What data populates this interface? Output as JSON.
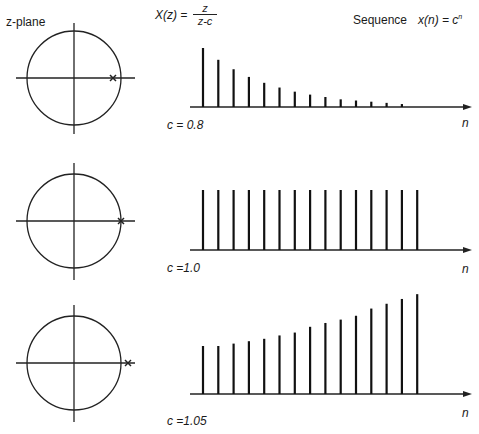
{
  "header": {
    "zplane_label": "z-plane",
    "transform_lhs": "X(z) =",
    "transform_num": "z",
    "transform_den": "z-c",
    "sequence_label": "Sequence",
    "sequence_formula": "x(n) = c",
    "sequence_exponent": "n"
  },
  "panels": [
    {
      "c_label": "c = 0.8",
      "n_label": "n",
      "c": 0.8
    },
    {
      "c_label": "c =1.0",
      "n_label": "n",
      "c": 1.0
    },
    {
      "c_label": "c =1.05",
      "n_label": "n",
      "c": 1.05
    }
  ],
  "chart_data": [
    {
      "type": "stem",
      "title": "c = 0.8",
      "xlabel": "n",
      "x": [
        0,
        1,
        2,
        3,
        4,
        5,
        6,
        7,
        8,
        9,
        10,
        11,
        12,
        13
      ],
      "values": [
        1.0,
        0.8,
        0.64,
        0.51,
        0.41,
        0.33,
        0.26,
        0.21,
        0.17,
        0.13,
        0.11,
        0.09,
        0.07,
        0.05
      ],
      "pole": 0.8
    },
    {
      "type": "stem",
      "title": "c =1.0",
      "xlabel": "n",
      "x": [
        0,
        1,
        2,
        3,
        4,
        5,
        6,
        7,
        8,
        9,
        10,
        11,
        12,
        13,
        14
      ],
      "values": [
        1,
        1,
        1,
        1,
        1,
        1,
        1,
        1,
        1,
        1,
        1,
        1,
        1,
        1,
        1
      ],
      "pole": 1.0
    },
    {
      "type": "stem",
      "title": "c =1.05",
      "xlabel": "n",
      "x": [
        0,
        1,
        2,
        3,
        4,
        5,
        6,
        7,
        8,
        9,
        10,
        11,
        12,
        13,
        14
      ],
      "values": [
        1.0,
        1.0,
        1.05,
        1.1,
        1.15,
        1.22,
        1.28,
        1.4,
        1.48,
        1.55,
        1.63,
        1.78,
        1.88,
        1.98,
        2.08
      ],
      "pole": 1.05
    }
  ]
}
